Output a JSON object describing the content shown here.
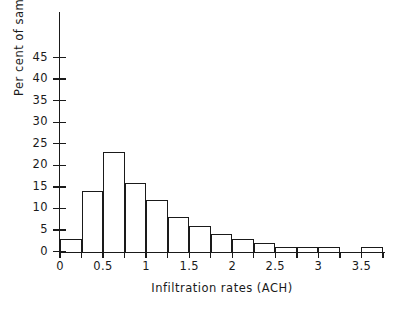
{
  "chart_data": {
    "type": "bar",
    "title": "",
    "subtitle": "",
    "xlabel": "Infiltration rates (ACH)",
    "ylabel": "Per cent of sample",
    "xlim": [
      0,
      3.75
    ],
    "ylim": [
      0,
      50
    ],
    "grid": false,
    "legend": null,
    "bin_width": 0.25,
    "bin_edges": [
      0,
      0.25,
      0.5,
      0.75,
      1,
      1.25,
      1.5,
      1.75,
      2,
      2.25,
      2.5,
      2.75,
      3,
      3.25,
      3.5,
      3.75
    ],
    "categories": [
      "0-0.25",
      "0.25-0.5",
      "0.5-0.75",
      "0.75-1",
      "1-1.25",
      "1.25-1.5",
      "1.5-1.75",
      "1.75-2",
      "2-2.25",
      "2.25-2.5",
      "2.5-2.75",
      "2.75-3",
      "3-3.25",
      "3.25-3.5",
      "3.5-3.75"
    ],
    "values": [
      3,
      14,
      23,
      16,
      12,
      8,
      6,
      4,
      3,
      2,
      1,
      1,
      1,
      0,
      1
    ],
    "x_tick_labels": [
      "0",
      "0.5",
      "1",
      "1.5",
      "2",
      "2.5",
      "3",
      "3.5"
    ],
    "x_tick_values": [
      0,
      0.5,
      1,
      1.5,
      2,
      2.5,
      3,
      3.5
    ],
    "x_minor_tick_values": [
      0.25,
      0.75,
      1.25,
      1.75,
      2.25,
      2.75,
      3.25,
      3.75
    ],
    "y_tick_labels": [
      "0",
      "5",
      "10",
      "15",
      "20",
      "25",
      "30",
      "35",
      "40",
      "45"
    ],
    "y_tick_values": [
      0,
      5,
      10,
      15,
      20,
      25,
      30,
      35,
      40,
      45
    ],
    "colors": {
      "axis": "#1a1a1a",
      "bar_stroke": "#1a1a1a",
      "bar_fill": "transparent",
      "background": "#ffffff"
    }
  }
}
